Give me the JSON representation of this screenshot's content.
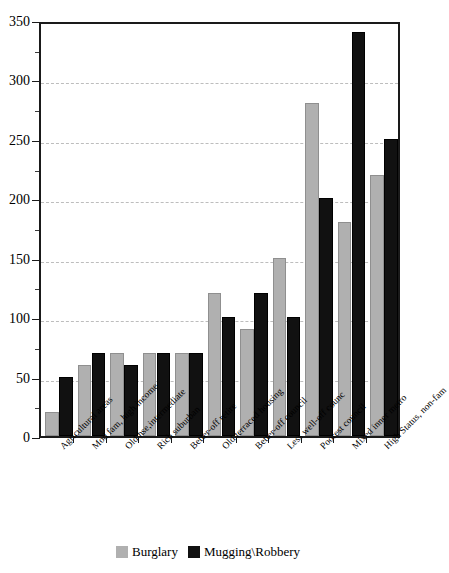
{
  "chart_data": {
    "type": "bar",
    "title": "",
    "xlabel": "",
    "ylabel": "",
    "ylim": [
      0,
      350
    ],
    "ytick_step": 50,
    "yminor_step": 25,
    "grid": true,
    "legend_position": "bottom",
    "categories": [
      "Agricultural areas",
      "Mod fam, high income",
      "Old hse,intermediate",
      "Rich suburban",
      "Better-off retire",
      "Old terraced housing",
      "Better-off council",
      "Less well-off counc",
      "Poorest council",
      "Mixed inner metro",
      "High Status, non-fam"
    ],
    "yticks": [
      "0",
      "50",
      "100",
      "150",
      "200",
      "250",
      "300",
      "350"
    ],
    "series": [
      {
        "name": "Burglary",
        "color": "#b0b0b0",
        "values": [
          20,
          60,
          70,
          70,
          70,
          120,
          90,
          150,
          280,
          180,
          220
        ]
      },
      {
        "name": "Mugging\\Robbery",
        "color": "#111111",
        "values": [
          50,
          70,
          60,
          70,
          70,
          100,
          120,
          100,
          200,
          340,
          250
        ]
      }
    ]
  }
}
